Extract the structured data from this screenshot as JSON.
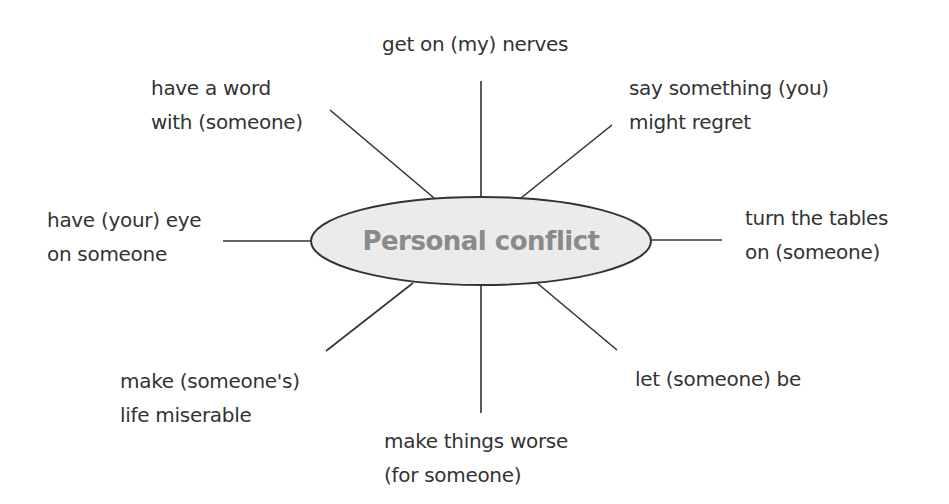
{
  "diagram": {
    "type": "spider-diagram",
    "center": {
      "label": "Personal conflict",
      "fill": "#ebebeb",
      "stroke": "#333333",
      "text_color": "#8a8a8a"
    },
    "line_color": "#333333",
    "text_color": "#333333",
    "branches": [
      {
        "position": "top",
        "lines": [
          "get on (my) nerves"
        ]
      },
      {
        "position": "top-left",
        "lines": [
          "have a word",
          "with (someone)"
        ]
      },
      {
        "position": "top-right",
        "lines": [
          "say something (you)",
          "might regret"
        ]
      },
      {
        "position": "left",
        "lines": [
          "have (your) eye",
          "on someone"
        ]
      },
      {
        "position": "right",
        "lines": [
          "turn the tables",
          "on (someone)"
        ]
      },
      {
        "position": "bottom-left",
        "lines": [
          "make (someone's)",
          "life miserable"
        ]
      },
      {
        "position": "bottom-right",
        "lines": [
          "let (someone) be"
        ]
      },
      {
        "position": "bottom",
        "lines": [
          "make things worse",
          "(for someone)"
        ]
      }
    ]
  }
}
